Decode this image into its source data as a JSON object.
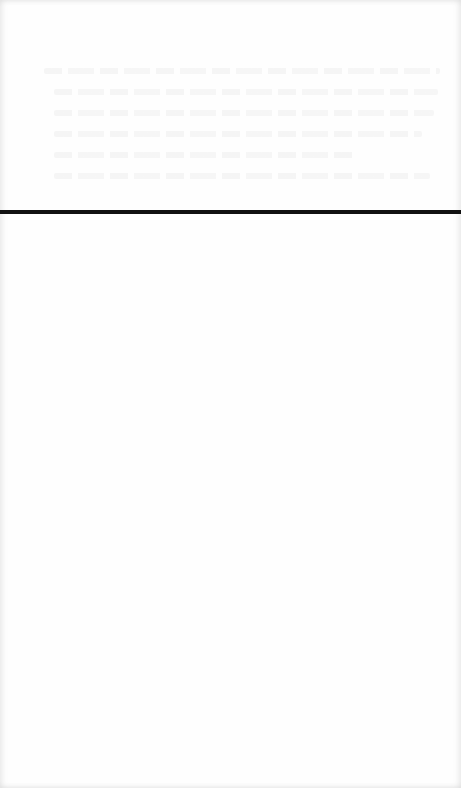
{
  "page": {
    "background_color": "#fefefe",
    "rule_color": "#111111"
  },
  "content": {
    "bleedthrough_text_lines": 6,
    "legible_text": ""
  }
}
